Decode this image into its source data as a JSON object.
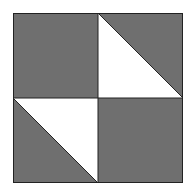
{
  "diagram": {
    "type": "quilt-block",
    "colors": {
      "fill": "#6f6f6f",
      "light": "#ffffff",
      "stroke": "#222222",
      "background": "#ffffff"
    },
    "grid": {
      "rows": 2,
      "cols": 2
    },
    "patches": [
      {
        "position": "top-left",
        "kind": "solid",
        "color": "gray"
      },
      {
        "position": "top-right",
        "kind": "half-square-triangle",
        "white_half": "lower-left",
        "gray_half": "upper-right"
      },
      {
        "position": "bottom-left",
        "kind": "half-square-triangle",
        "white_half": "upper-right",
        "gray_half": "lower-left"
      },
      {
        "position": "bottom-right",
        "kind": "solid",
        "color": "gray"
      }
    ]
  }
}
